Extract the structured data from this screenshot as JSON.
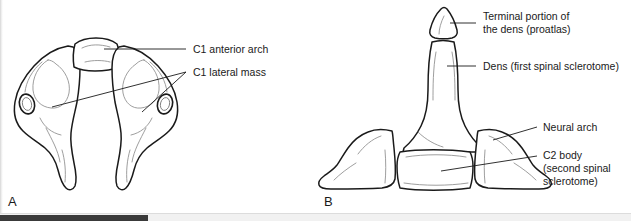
{
  "figure": {
    "panels": [
      {
        "letter": "A",
        "subject": "C1 atlas vertebra, superior view",
        "labels": [
          {
            "id": "c1-anterior-arch",
            "text": "C1 anterior arch"
          },
          {
            "id": "c1-lateral-mass",
            "text": "C1 lateral mass"
          }
        ]
      },
      {
        "letter": "B",
        "subject": "C2 axis vertebra, anterior view",
        "labels": [
          {
            "id": "terminal-portion-dens",
            "line1": "Terminal portion of",
            "line2": "the dens (proatlas)"
          },
          {
            "id": "dens",
            "line1": "Dens (first spinal sclerotome)"
          },
          {
            "id": "neural-arch",
            "line1": "Neural arch"
          },
          {
            "id": "c2-body",
            "line1": "C2 body",
            "line2": "(second spinal",
            "line3": "sclerotome)"
          }
        ]
      }
    ]
  },
  "colors": {
    "background": "#ffffff",
    "ink": "#1a1a1a",
    "shading": "#8c8c8c",
    "scrollbar_track": "#f1f1f1",
    "scrollbar_thumb": "#3a3a3a"
  },
  "scrollbar": {
    "orientation": "horizontal",
    "thumb_position": "left"
  }
}
